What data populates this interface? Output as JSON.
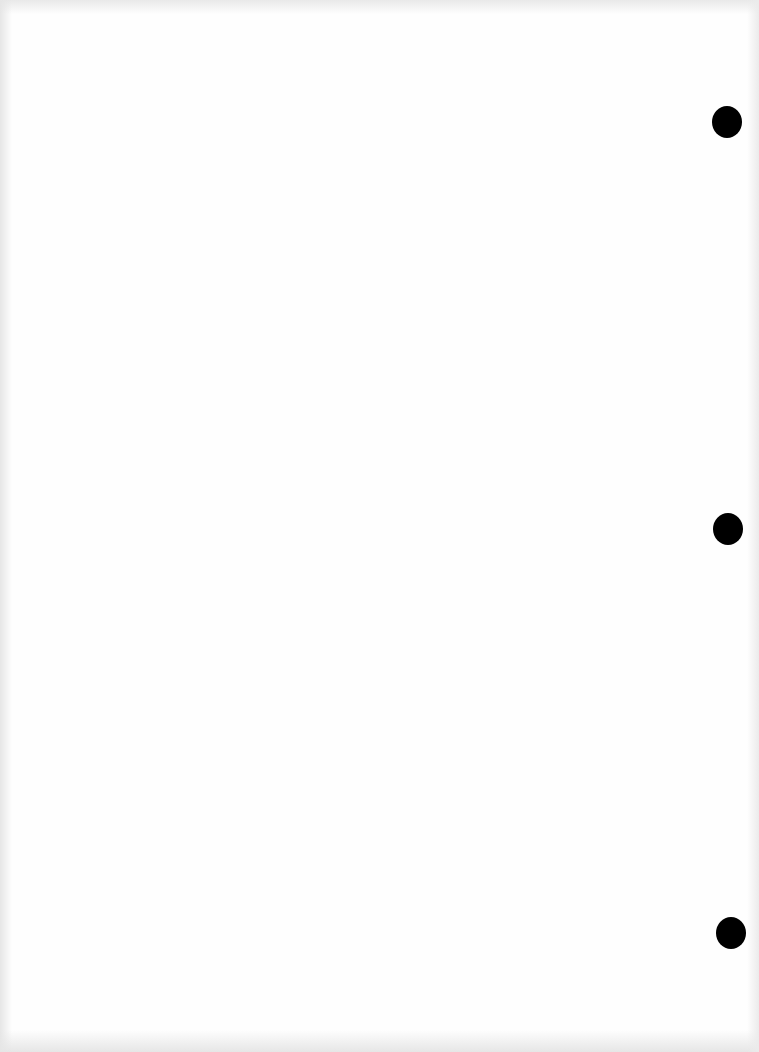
{
  "document": {
    "type": "scanned-page",
    "content_text": "",
    "background_color": "#fefefe",
    "punch_holes": [
      {
        "position": "top",
        "color": "#000000"
      },
      {
        "position": "middle",
        "color": "#000000"
      },
      {
        "position": "bottom",
        "color": "#000000"
      }
    ]
  }
}
